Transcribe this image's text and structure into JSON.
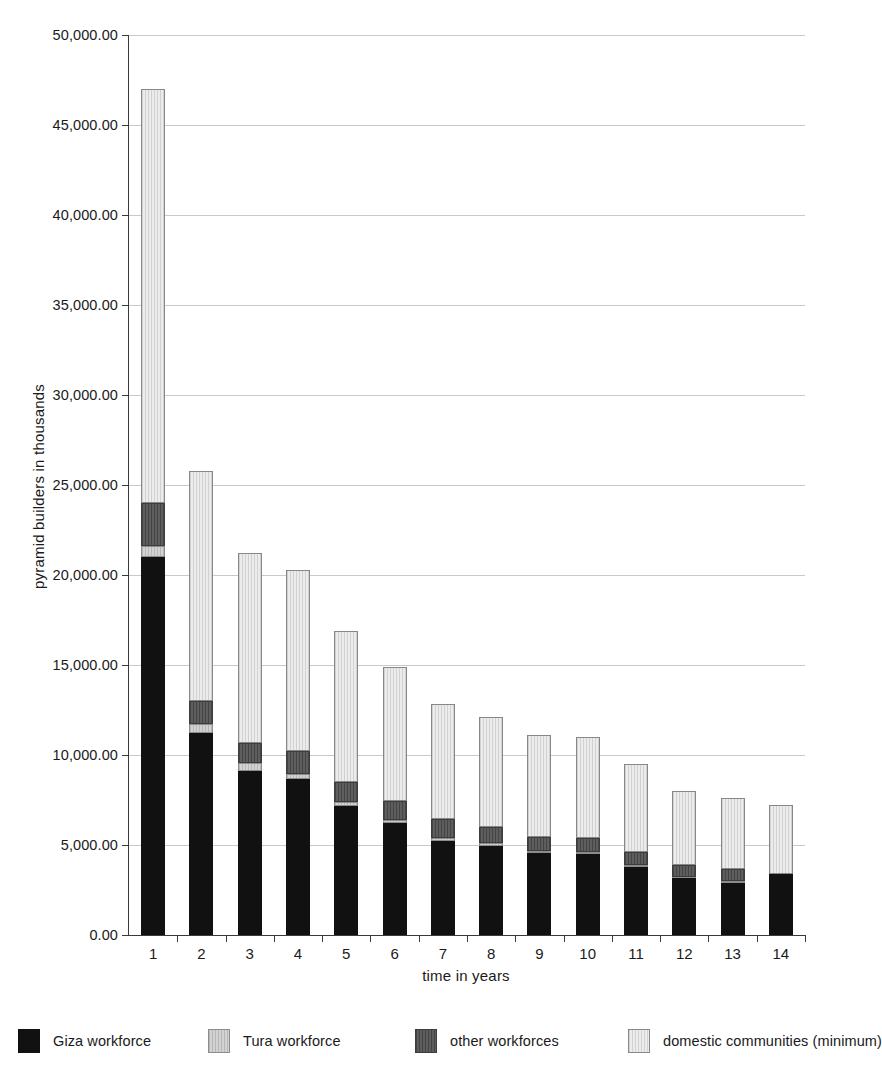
{
  "chart_data": {
    "type": "bar",
    "subtype": "stacked-column",
    "title": "",
    "xlabel": "time in years",
    "ylabel": "pyramid builders in thousands",
    "categories": [
      "1",
      "2",
      "3",
      "4",
      "5",
      "6",
      "7",
      "8",
      "9",
      "10",
      "11",
      "12",
      "13",
      "14"
    ],
    "ylim": [
      0,
      50000
    ],
    "ytick_labels": [
      "0.00",
      "5,000.00",
      "10,000.00",
      "15,000.00",
      "20,000.00",
      "25,000.00",
      "30,000.00",
      "35,000.00",
      "40,000.00",
      "45,000.00",
      "50,000.00"
    ],
    "ytick_values": [
      0,
      5000,
      10000,
      15000,
      20000,
      25000,
      30000,
      35000,
      40000,
      45000,
      50000
    ],
    "grid": true,
    "legend_position": "bottom",
    "series": [
      {
        "name": "Giza workforce",
        "color": "#111111",
        "values": [
          21000,
          11200,
          9100,
          8650,
          7150,
          6200,
          5250,
          4950,
          4550,
          4500,
          3800,
          3150,
          2900,
          3400
        ]
      },
      {
        "name": "Tura workforce",
        "color": "#d2d2d2",
        "values": [
          600,
          500,
          450,
          300,
          250,
          200,
          150,
          150,
          100,
          100,
          100,
          100,
          100,
          0
        ]
      },
      {
        "name": "other workforces",
        "color": "#5e5e5e",
        "values": [
          2400,
          1300,
          1100,
          1250,
          1100,
          1050,
          1050,
          900,
          800,
          800,
          700,
          650,
          650,
          0
        ]
      },
      {
        "name": "domestic communities (minimum)",
        "color": "#ececec",
        "values": [
          23000,
          12800,
          10550,
          10100,
          8400,
          7450,
          6400,
          6100,
          5650,
          5600,
          4900,
          4100,
          3950,
          3800
        ]
      }
    ],
    "totals": [
      47000,
      25800,
      21200,
      20300,
      16900,
      14900,
      12850,
      12100,
      11100,
      11000,
      9500,
      8000,
      7600,
      7200
    ]
  },
  "legend": {
    "items": [
      {
        "label": "Giza workforce",
        "swatch": "giza-swatch"
      },
      {
        "label": "Tura workforce",
        "swatch": "tura-swatch"
      },
      {
        "label": "other workforces",
        "swatch": "other-swatch"
      },
      {
        "label": "domestic communities (minimum)",
        "swatch": "domestic-swatch"
      }
    ]
  }
}
